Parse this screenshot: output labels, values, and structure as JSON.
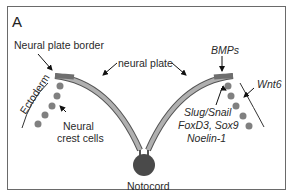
{
  "figure": {
    "panel_label": "A",
    "colors": {
      "frame": "#6a6a6a",
      "neural_plate_fill": "#a9a9a9",
      "neural_plate_outline": "#555555",
      "border_region": "#6e6e6e",
      "cells": "#808080",
      "notochord": "#4a4a4a",
      "arrows": "#111111"
    }
  },
  "labels": {
    "neural_plate_border": "Neural plate border",
    "neural_plate": "neural plate",
    "ectoderm": "Ectoderm",
    "neural_crest_line1": "Neural",
    "neural_crest_line2": "crest cells",
    "notochord": "Notocord",
    "bmps": "BMPs",
    "wnt6": "Wnt6",
    "markers_line1": "Slug/Snail",
    "markers_line2": "FoxD3, Sox9",
    "markers_line3": "Noelin-1"
  }
}
